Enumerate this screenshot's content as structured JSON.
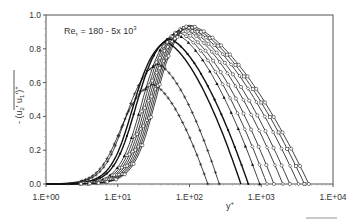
{
  "chart_data": {
    "type": "line",
    "title": "",
    "annotation": "Reτ = 180 - 5x 10³",
    "annotation_parts": {
      "base": "Re",
      "sub": "τ",
      "rest": " = 180 - 5x 10",
      "sup": "3"
    },
    "xlabel": "y+",
    "xlabel_parts": {
      "base": "y",
      "sup": "+"
    },
    "ylabel": "-(u2' u1')+",
    "ylabel_parts": {
      "prefix": "- (",
      "u2": "u",
      "s2": "2",
      "p2": "' ",
      "u1": "u",
      "s1": "1",
      "p1": "')",
      "sup": "+"
    },
    "xscale": "log",
    "xlim": [
      1,
      10000
    ],
    "ylim": [
      0.0,
      1.0
    ],
    "x_ticks": [
      "1.E+00",
      "1.E+01",
      "1.E+02",
      "1.E+03",
      "1.E+04"
    ],
    "y_ticks": [
      "0.0",
      "0.2",
      "0.4",
      "0.6",
      "0.8",
      "1.0"
    ],
    "grid": false,
    "legend": "none",
    "series": [
      {
        "name": "Re_tau=180",
        "marker": "plus",
        "peak_y_plus": 30,
        "peak_value": 0.59,
        "end_y_plus": 180
      },
      {
        "name": "Re_tau=260",
        "marker": "plus",
        "peak_y_plus": 35,
        "peak_value": 0.71,
        "end_y_plus": 260
      },
      {
        "name": "Re_tau=520",
        "marker": "line",
        "peak_y_plus": 45,
        "peak_value": 0.84,
        "end_y_plus": 520
      },
      {
        "name": "Re_tau=660",
        "marker": "dot",
        "peak_y_plus": 50,
        "peak_value": 0.86,
        "end_y_plus": 660
      },
      {
        "name": "Re_tau=950",
        "marker": "triangle",
        "peak_y_plus": 60,
        "peak_value": 0.89,
        "end_y_plus": 950
      },
      {
        "name": "Re_tau=1200",
        "marker": "diamond",
        "peak_y_plus": 65,
        "peak_value": 0.9,
        "end_y_plus": 1200
      },
      {
        "name": "Re_tau=1500",
        "marker": "circle",
        "peak_y_plus": 70,
        "peak_value": 0.91,
        "end_y_plus": 1500
      },
      {
        "name": "Re_tau=2000",
        "marker": "diamond",
        "peak_y_plus": 75,
        "peak_value": 0.92,
        "end_y_plus": 2000
      },
      {
        "name": "Re_tau=2500",
        "marker": "circle",
        "peak_y_plus": 80,
        "peak_value": 0.925,
        "end_y_plus": 2500
      },
      {
        "name": "Re_tau=3300",
        "marker": "diamond",
        "peak_y_plus": 85,
        "peak_value": 0.93,
        "end_y_plus": 3300
      },
      {
        "name": "Re_tau=4000",
        "marker": "square",
        "peak_y_plus": 90,
        "peak_value": 0.935,
        "end_y_plus": 4000
      },
      {
        "name": "Re_tau=5000",
        "marker": "circle",
        "peak_y_plus": 95,
        "peak_value": 0.94,
        "end_y_plus": 4600
      }
    ]
  },
  "layout": {
    "plot_left": 46,
    "plot_right": 333,
    "plot_top": 15,
    "plot_bottom": 184,
    "frame_color": "#555555",
    "curve_color": "#111111"
  }
}
